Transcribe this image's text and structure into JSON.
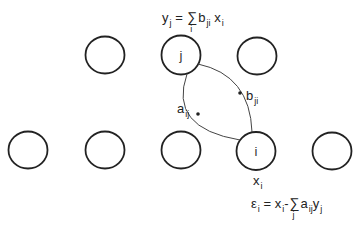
{
  "diagram": {
    "top_equation": {
      "lhs": "y",
      "lhs_sub": "j",
      "eq": "=",
      "sum_symbol": "∑",
      "sum_index": "i",
      "term": "b",
      "term_sub": "ji",
      "var": "x",
      "var_sub": "i"
    },
    "bottom_equation": {
      "lhs": "ε",
      "lhs_sub": "i",
      "eq": "=",
      "x": "x",
      "x_sub": "i",
      "minus": "-",
      "sum_symbol": "∑",
      "sum_index": "j",
      "term": "a",
      "term_sub": "ij",
      "var": "y",
      "var_sub": "j"
    },
    "node_j_label": "j",
    "node_i_label": "i",
    "node_i_var": {
      "name": "x",
      "sub": "i"
    },
    "edge_b_label": {
      "name": "b",
      "sub": "ji"
    },
    "edge_a_label": {
      "name": "a",
      "sub": "ij"
    },
    "top_row_count": 3,
    "bottom_row_count": 5
  }
}
